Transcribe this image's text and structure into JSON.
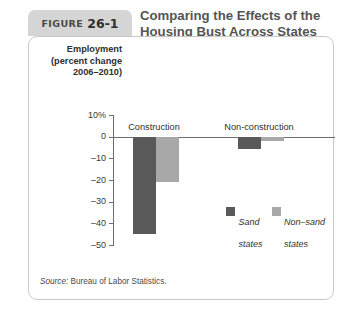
{
  "figure": {
    "tab_label": "FIGURE",
    "tab_number": "26-1",
    "title_line1": "Comparing the Effects of the",
    "title_line2": "Housing Bust Across States",
    "source": "Source: Bureau of Labor Statistics.",
    "source_prefix": "Source:"
  },
  "colors": {
    "dark": "#595959",
    "light": "#a8a8a8",
    "axis": "#6e6e6e",
    "tab_bg": "#d5d5d5",
    "panel_border": "#c9c9c9",
    "title_text": "#555555"
  },
  "chart_data": {
    "type": "bar",
    "title": "Comparing the Effects of the Housing Bust Across States",
    "ylabel": "Employment (percent change 2006–2010)",
    "ylabel_line1": "Employment",
    "ylabel_line2": "(percent change",
    "ylabel_line3": "2006–2010)",
    "xlabel": "",
    "categories": [
      "Construction",
      "Non-construction"
    ],
    "series": [
      {
        "name": "Sand\nstates",
        "legend_line1": "Sand",
        "legend_line2": "states",
        "color": "#595959",
        "values": [
          -45,
          -5.5
        ]
      },
      {
        "name": "Non-sand\nstates",
        "legend_line1": "Non–sand",
        "legend_line2": "states",
        "color": "#a8a8a8",
        "values": [
          -21,
          -2
        ]
      }
    ],
    "ylim": [
      -50,
      10
    ],
    "yticks": [
      10,
      0,
      -10,
      -20,
      -30,
      -40,
      -50
    ],
    "ytick_labels": [
      "10%",
      "0",
      "–10",
      "–20",
      "–30",
      "–40",
      "–50"
    ],
    "grid": false,
    "legend_position": "inside-right"
  }
}
